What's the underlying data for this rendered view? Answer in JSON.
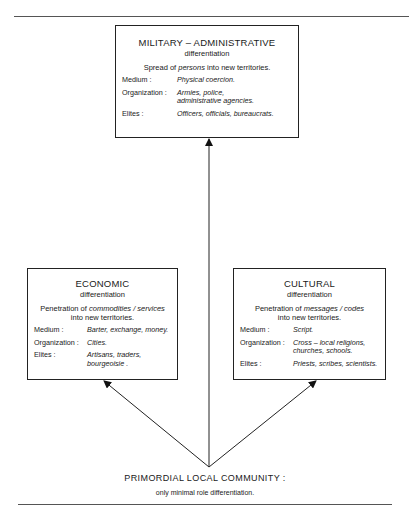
{
  "military": {
    "title": "MILITARY – ADMINISTRATIVE",
    "subtitle": "differentiation",
    "desc_pre": "Spread of ",
    "desc_em": "persons",
    "desc_post": " into new territories.",
    "rows": [
      {
        "label": "Medium :",
        "value": "Physical coercion."
      },
      {
        "label": "Organization :",
        "value": "Armies,  police,",
        "value2": "administrative  agencies."
      },
      {
        "label": "Elites :",
        "value": "Officers, officials, bureaucrats."
      }
    ]
  },
  "economic": {
    "title": "ECONOMIC",
    "subtitle": "differentiation",
    "desc_pre": "Penetration of ",
    "desc_em": "commodities / services",
    "desc_post": "into new territories.",
    "rows": [
      {
        "label": "Medium :",
        "value": "Barter, exchange, money."
      },
      {
        "label": "Organization :",
        "value": "Cities."
      },
      {
        "label": "Elites :",
        "value": "Artisans, traders,",
        "value2": "bourgeoisie ."
      }
    ]
  },
  "cultural": {
    "title": "CULTURAL",
    "subtitle": "differentiation",
    "desc_pre": "Penetration of ",
    "desc_em": "messages / codes",
    "desc_post": "into new territories.",
    "rows": [
      {
        "label": "Medium :",
        "value": "Script."
      },
      {
        "label": "Organization :",
        "value": "Cross – local religions,",
        "value2": "churches, schools."
      },
      {
        "label": "Elites :",
        "value": "Priests, scribes, scientists."
      }
    ]
  },
  "base": {
    "title": "PRIMORDIAL  LOCAL  COMMUNITY :",
    "subtitle": "only minimal role differentiation."
  }
}
